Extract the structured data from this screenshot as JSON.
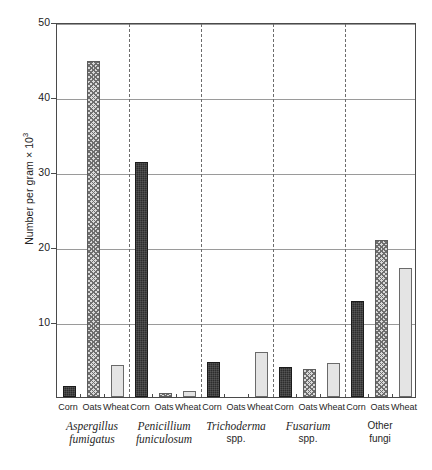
{
  "chart_data": {
    "type": "bar",
    "title": "",
    "xlabel": "",
    "ylabel": "Number per gram × 10",
    "ylabel_exponent": "3",
    "ylim": [
      0,
      50
    ],
    "yticks": [
      0,
      10,
      20,
      30,
      40,
      50
    ],
    "ytick_labels": [
      "",
      "10",
      "20",
      "30",
      "40",
      "50"
    ],
    "grid": true,
    "legend_position": "none",
    "categories": [
      "Corn",
      "Oats",
      "Wheat"
    ],
    "groups": [
      {
        "name_line1": "Aspergillus",
        "name_line2": "fumigatus",
        "style1": "italic",
        "style2": "italic",
        "values": [
          1.5,
          44.8,
          4.3
        ]
      },
      {
        "name_line1": "Penicillium",
        "name_line2": "funiculosum",
        "style1": "italic",
        "style2": "italic",
        "values": [
          31.3,
          0.5,
          0.8
        ]
      },
      {
        "name_line1": "Trichoderma",
        "name_line2": "spp.",
        "style1": "italic",
        "style2": "plain",
        "values": [
          4.7,
          0,
          6.0
        ]
      },
      {
        "name_line1": "Fusarium",
        "name_line2": "spp.",
        "style1": "italic",
        "style2": "plain",
        "values": [
          4.0,
          3.7,
          4.6
        ]
      },
      {
        "name_line1": "Other",
        "name_line2": "fungi",
        "style1": "plain",
        "style2": "plain",
        "values": [
          12.8,
          20.9,
          17.2
        ]
      }
    ],
    "series_colors": {
      "Corn": "#2d2d2d",
      "Oats": "#d9d9d9",
      "Wheat": "#e4e4e4"
    }
  }
}
